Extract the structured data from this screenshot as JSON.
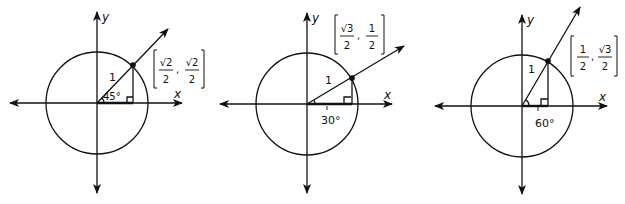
{
  "diagrams": [
    {
      "angle_deg": 45,
      "angle_label": "45°",
      "radius_label": "1",
      "x_axis_label": "x",
      "y_axis_label": "y",
      "point": {
        "x_num": "√2",
        "x_den": "2",
        "y_num": "√2",
        "y_den": "2"
      }
    },
    {
      "angle_deg": 30,
      "angle_label": "30°",
      "radius_label": "1",
      "x_axis_label": "x",
      "y_axis_label": "y",
      "point": {
        "x_num": "√3",
        "x_den": "2",
        "y_num": "1",
        "y_den": "2"
      }
    },
    {
      "angle_deg": 60,
      "angle_label": "60°",
      "radius_label": "1",
      "x_axis_label": "x",
      "y_axis_label": "y",
      "point": {
        "x_num": "1",
        "x_den": "2",
        "y_num": "√3",
        "y_den": "2"
      }
    }
  ]
}
